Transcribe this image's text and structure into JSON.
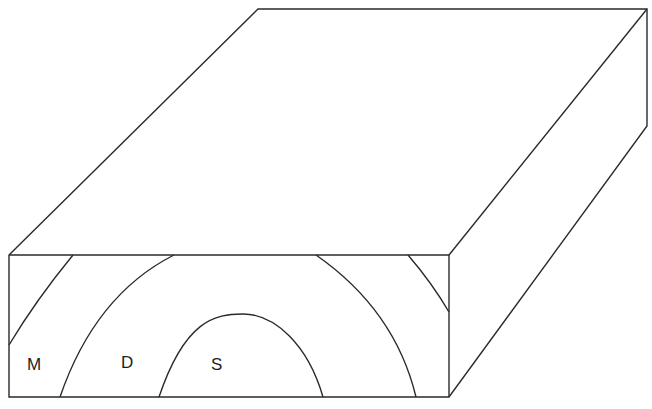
{
  "diagram": {
    "type": "block-diagram",
    "colors": {
      "line": "#2a2a2a",
      "background": "#ffffff",
      "label": "#1e1e1e"
    },
    "block": {
      "front_face": {
        "x1": 9,
        "y1": 255,
        "x2": 449,
        "y2": 397
      },
      "top_back_left": [
        258,
        9
      ],
      "top_back_right": [
        647,
        9
      ],
      "side_back_bottom": [
        647,
        126
      ]
    },
    "zones": [
      {
        "id": "M",
        "label": "M",
        "x": 27,
        "y": 356
      },
      {
        "id": "D",
        "label": "D",
        "x": 121,
        "y": 354
      },
      {
        "id": "S",
        "label": "S",
        "x": 211,
        "y": 356
      }
    ],
    "contacts": [
      {
        "name": "outer-left-contact",
        "path": "M73,255 Q36,300 9,345"
      },
      {
        "name": "outer-right-contact",
        "path": "M408,255 Q432,283 449,312"
      },
      {
        "name": "middle-contact",
        "path": "M60,397 Q95,295 174,255 M316,255 Q395,310 416,397"
      },
      {
        "name": "core-contact",
        "path": "M159,397 C185,320 215,314 243,314 C275,314 308,345 323,397"
      }
    ]
  }
}
